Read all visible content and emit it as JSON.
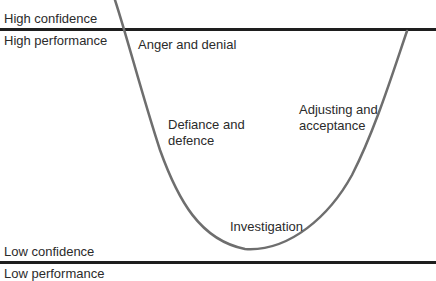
{
  "axis_labels": {
    "top_above": "High confidence",
    "top_below": "High performance",
    "bottom_above": "Low confidence",
    "bottom_below": "Low performance"
  },
  "stages": [
    {
      "label_line1": "Anger and denial",
      "label_line2": ""
    },
    {
      "label_line1": "Defiance and",
      "label_line2": "defence"
    },
    {
      "label_line1": "Investigation",
      "label_line2": ""
    },
    {
      "label_line1": "Adjusting and",
      "label_line2": "acceptance"
    }
  ],
  "colors": {
    "curve": "#6e6e6e",
    "baseline": "#1e1e1e",
    "text": "#2b2b2b"
  }
}
